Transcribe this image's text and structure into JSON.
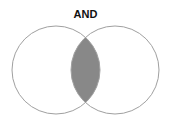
{
  "title": "AND",
  "diagram": {
    "type": "venn",
    "sets": 2,
    "highlighted_region": "intersection",
    "colors": {
      "outline": "#999999",
      "fill": "#888888",
      "background": "#ffffff"
    }
  }
}
